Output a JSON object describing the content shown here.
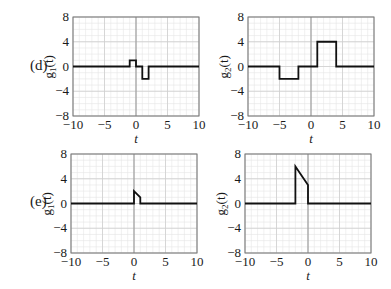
{
  "rows": [
    {
      "label": "(d)",
      "top": 17
    },
    {
      "label": "(e)",
      "top": 154
    }
  ],
  "chart_data": [
    {
      "type": "line",
      "row": "(d)",
      "ylabel": "g1(t)",
      "ylabel_base": "g",
      "ylabel_sub": "1",
      "ylabel_tail": "(t)",
      "xlabel": "t",
      "xlim": [
        -10,
        10
      ],
      "ylim": [
        -8,
        8
      ],
      "grid": true,
      "xticks": [
        -10,
        -5,
        0,
        5,
        10
      ],
      "yticks": [
        -8,
        -4,
        0,
        4,
        8
      ],
      "box": {
        "x": 73,
        "y": 17,
        "w": 126,
        "h": 99
      },
      "points": [
        [
          -10,
          0
        ],
        [
          -1,
          0
        ],
        [
          -1,
          1
        ],
        [
          0,
          1
        ],
        [
          0,
          0
        ],
        [
          1,
          0
        ],
        [
          1,
          -2
        ],
        [
          2,
          -2
        ],
        [
          2,
          0
        ],
        [
          10,
          0
        ]
      ]
    },
    {
      "type": "line",
      "row": "(d)",
      "ylabel": "g2(t)",
      "ylabel_base": "g",
      "ylabel_sub": "2",
      "ylabel_tail": "(t)",
      "xlabel": "t",
      "xlim": [
        -10,
        10
      ],
      "ylim": [
        -8,
        8
      ],
      "grid": true,
      "xticks": [
        -10,
        -5,
        0,
        5,
        10
      ],
      "yticks": [
        -8,
        -4,
        0,
        4,
        8
      ],
      "box": {
        "x": 248,
        "y": 17,
        "w": 126,
        "h": 99
      },
      "points": [
        [
          -10,
          0
        ],
        [
          -5,
          0
        ],
        [
          -5,
          -2
        ],
        [
          -2,
          -2
        ],
        [
          -2,
          0
        ],
        [
          1,
          0
        ],
        [
          1,
          4
        ],
        [
          4,
          4
        ],
        [
          4,
          0
        ],
        [
          10,
          0
        ]
      ]
    },
    {
      "type": "line",
      "row": "(e)",
      "ylabel": "g1(t)",
      "ylabel_base": "g",
      "ylabel_sub": "1",
      "ylabel_tail": "(t)",
      "xlabel": "t",
      "xlim": [
        -10,
        10
      ],
      "ylim": [
        -8,
        8
      ],
      "grid": true,
      "xticks": [
        -10,
        -5,
        0,
        5,
        10
      ],
      "yticks": [
        -8,
        -4,
        0,
        4,
        8
      ],
      "box": {
        "x": 71,
        "y": 154,
        "w": 126,
        "h": 99
      },
      "points": [
        [
          -10,
          0
        ],
        [
          0,
          0
        ],
        [
          0,
          2
        ],
        [
          1,
          1
        ],
        [
          1,
          0
        ],
        [
          10,
          0
        ]
      ]
    },
    {
      "type": "line",
      "row": "(e)",
      "ylabel": "g2(t)",
      "ylabel_base": "g",
      "ylabel_sub": "2",
      "ylabel_tail": "(t)",
      "xlabel": "t",
      "xlim": [
        -10,
        10
      ],
      "ylim": [
        -8,
        8
      ],
      "grid": true,
      "xticks": [
        -10,
        -5,
        0,
        5,
        10
      ],
      "yticks": [
        -8,
        -4,
        0,
        4,
        8
      ],
      "box": {
        "x": 245,
        "y": 154,
        "w": 126,
        "h": 99
      },
      "points": [
        [
          -10,
          0
        ],
        [
          -2,
          0
        ],
        [
          -2,
          6
        ],
        [
          0,
          3
        ],
        [
          0,
          0
        ],
        [
          10,
          0
        ]
      ]
    }
  ],
  "tick_labels": {
    "-10": "−10",
    "-5": "−5",
    "0": "0",
    "5": "5",
    "10": "10",
    "-8": "−8",
    "-4": "−4",
    "4": "4",
    "8": "8"
  }
}
